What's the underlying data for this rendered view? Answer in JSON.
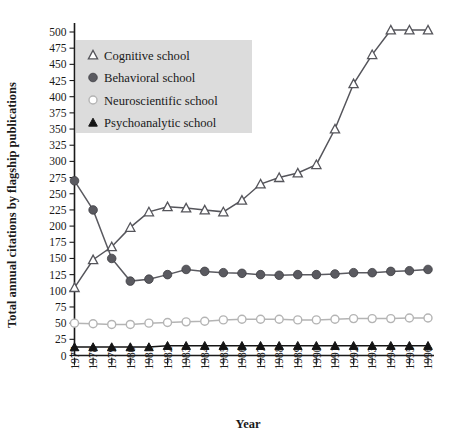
{
  "chart_data": {
    "type": "line",
    "title": "",
    "xlabel": "Year",
    "ylabel": "Total annual citations by flagship publications",
    "x": [
      1977,
      1978,
      1979,
      1980,
      1981,
      1982,
      1983,
      1984,
      1985,
      1986,
      1987,
      1988,
      1989,
      1990,
      1991,
      1992,
      1993,
      1994,
      1995,
      1996
    ],
    "categories": [
      "1977",
      "1978",
      "1979",
      "1980",
      "1981",
      "1982",
      "1983",
      "1984",
      "1985",
      "1986",
      "1987",
      "1988",
      "1989",
      "1990",
      "1991",
      "1992",
      "1993",
      "1994",
      "1995",
      "1996"
    ],
    "ylim": [
      0,
      510
    ],
    "yticks": [
      0,
      25,
      50,
      75,
      100,
      125,
      150,
      175,
      200,
      225,
      250,
      275,
      300,
      325,
      350,
      375,
      400,
      425,
      450,
      475,
      500
    ],
    "ytick_labels": [
      "0",
      "25",
      "50",
      "75",
      "100",
      "125",
      "150",
      "175",
      "200",
      "225",
      "250",
      "275",
      "300",
      "325",
      "350",
      "375",
      "400",
      "425",
      "450",
      "475",
      "500"
    ],
    "grid": false,
    "legend_position": "upper-left",
    "series": [
      {
        "name": "Cognitive school",
        "marker": "open-triangle",
        "color": "#55555b",
        "values": [
          105,
          148,
          168,
          198,
          222,
          230,
          228,
          225,
          222,
          240,
          265,
          275,
          282,
          295,
          350,
          420,
          465,
          503,
          503,
          503
        ]
      },
      {
        "name": "Behavioral school",
        "marker": "filled-circle",
        "color": "#5a5a60",
        "values": [
          270,
          225,
          150,
          115,
          118,
          125,
          133,
          130,
          128,
          127,
          125,
          124,
          125,
          125,
          126,
          128,
          128,
          130,
          131,
          133
        ]
      },
      {
        "name": "Neuroscientific school",
        "marker": "open-circle",
        "color": "#b4b4b4",
        "values": [
          50,
          49,
          48,
          48,
          50,
          51,
          52,
          53,
          55,
          56,
          56,
          56,
          55,
          55,
          56,
          57,
          57,
          57,
          58,
          58
        ]
      },
      {
        "name": "Psychoanalytic school",
        "marker": "filled-triangle",
        "color": "#141414",
        "values": [
          13,
          13,
          13,
          13,
          13,
          15,
          15,
          15,
          15,
          15,
          15,
          15,
          15,
          15,
          15,
          15,
          15,
          15,
          15,
          15
        ]
      }
    ]
  },
  "legend": {
    "items": [
      {
        "label": "Cognitive school",
        "marker": "open-triangle"
      },
      {
        "label": "Behavioral school",
        "marker": "filled-circle"
      },
      {
        "label": "Neuroscientific school",
        "marker": "open-circle"
      },
      {
        "label": "Psychoanalytic school",
        "marker": "filled-triangle"
      }
    ],
    "background_color": "#dcdcdc"
  },
  "axes": {
    "y_title": "Total annual citations by flagship publications",
    "x_title": "Year"
  }
}
